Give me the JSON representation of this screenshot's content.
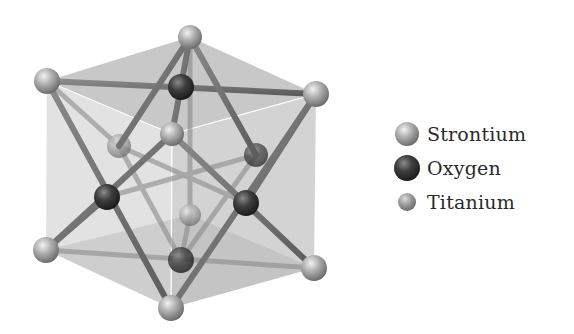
{
  "figure": {
    "type": "crystal-structure",
    "structure": "perovskite unit cell"
  },
  "legend": {
    "items": [
      {
        "label": "Strontium",
        "color": "#9a9a9a",
        "size": "large",
        "icon": "light-sphere-icon"
      },
      {
        "label": "Oxygen",
        "color": "#3a3a3a",
        "size": "large",
        "icon": "dark-sphere-icon"
      },
      {
        "label": "Titanium",
        "color": "#a4a4a4",
        "size": "small",
        "icon": "small-sphere-icon"
      }
    ]
  },
  "colors": {
    "face_light": "#d6d6d6",
    "face_dark": "#a8a8a8",
    "bond": "#6e6e6e",
    "strontium": "#9a9a9a",
    "oxygen": "#3a3a3a",
    "titanium": "#a4a4a4"
  }
}
